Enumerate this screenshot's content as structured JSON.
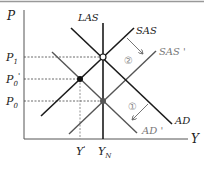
{
  "diagram": {
    "axes": {
      "y_label": "P",
      "x_label": "Y"
    },
    "price_levels": {
      "p1": {
        "label": "P",
        "sub": "1"
      },
      "p0_prime": {
        "label": "P",
        "sub": "0",
        "prime": "'"
      },
      "p0": {
        "label": "P",
        "sub": "0"
      }
    },
    "output_levels": {
      "y_prime": {
        "label": "Y",
        "prime": "'"
      },
      "y_n": {
        "label": "Y",
        "sub": "N"
      }
    },
    "curves": {
      "las": "LAS",
      "sas": "SAS",
      "sas_prime": "SAS '",
      "ad": "AD",
      "ad_prime": "AD '"
    },
    "annotations": {
      "step1": "①",
      "step2": "②"
    },
    "colors": {
      "primary_line": "#1a1a1a",
      "shifted_line": "#555555",
      "dashed": "#444444",
      "arrow": "#666666",
      "frame": "#999999"
    }
  }
}
